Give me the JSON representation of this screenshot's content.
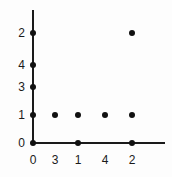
{
  "chart_data": {
    "type": "scatter",
    "title": "",
    "xlabel": "",
    "ylabel": "",
    "grid": false,
    "legend": null,
    "x_tick_labels": [
      "0",
      "3",
      "1",
      "4",
      "2"
    ],
    "y_tick_labels": [
      "2",
      "4",
      "3",
      "1",
      "0"
    ],
    "x_tick_positions_px": [
      33,
      55,
      78,
      105,
      132
    ],
    "y_tick_positions_px": [
      33,
      65,
      87,
      115,
      143
    ],
    "axis_origin_px": [
      33,
      143
    ],
    "x_axis_end_px": 165,
    "y_axis_top_px": 10,
    "marker_color": "#111111",
    "axis_color": "#1a1a1a",
    "background_color": "#fdfdfd",
    "points": [
      {
        "x_label": "0",
        "y_label": "2",
        "cx": 33,
        "cy": 33
      },
      {
        "x_label": "0",
        "y_label": "4",
        "cx": 33,
        "cy": 65
      },
      {
        "x_label": "0",
        "y_label": "3",
        "cx": 33,
        "cy": 87
      },
      {
        "x_label": "0",
        "y_label": "1",
        "cx": 33,
        "cy": 115
      },
      {
        "x_label": "0",
        "y_label": "0",
        "cx": 33,
        "cy": 143
      },
      {
        "x_label": "3",
        "y_label": "1",
        "cx": 55,
        "cy": 115
      },
      {
        "x_label": "1",
        "y_label": "1",
        "cx": 78,
        "cy": 115
      },
      {
        "x_label": "4",
        "y_label": "1",
        "cx": 105,
        "cy": 115
      },
      {
        "x_label": "2",
        "y_label": "1",
        "cx": 132,
        "cy": 115
      },
      {
        "x_label": "1",
        "y_label": "0",
        "cx": 78,
        "cy": 143
      },
      {
        "x_label": "2",
        "y_label": "0",
        "cx": 132,
        "cy": 143
      },
      {
        "x_label": "2",
        "y_label": "2",
        "cx": 132,
        "cy": 33
      }
    ]
  }
}
